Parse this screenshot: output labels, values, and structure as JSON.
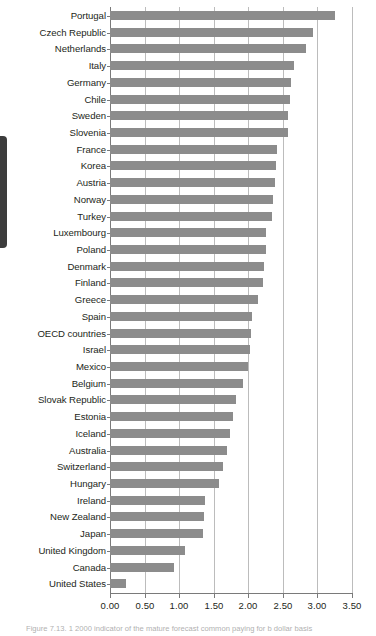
{
  "figure": {
    "caption": "Figure 7.13. 1 2000 indicator of the mature forecast common paying for   b   dollar basis"
  },
  "chart_data": {
    "type": "bar",
    "orientation": "horizontal",
    "title": "",
    "xlabel": "",
    "ylabel": "",
    "xlim": [
      0.0,
      3.5
    ],
    "xticks": [
      "0.00",
      "0.50",
      "1.00",
      "1.50",
      "2.00",
      "2.50",
      "3.00",
      "3.50"
    ],
    "xtick_values": [
      0.0,
      0.5,
      1.0,
      1.5,
      2.0,
      2.5,
      3.0,
      3.5
    ],
    "grid": true,
    "legend": false,
    "bar_color": "#8c8c8c",
    "categories": [
      "Portugal",
      "Czech Republic",
      "Netherlands",
      "Italy",
      "Germany",
      "Chile",
      "Sweden",
      "Slovenia",
      "France",
      "Korea",
      "Austria",
      "Norway",
      "Turkey",
      "Luxembourg",
      "Poland",
      "Denmark",
      "Finland",
      "Greece",
      "Spain",
      "OECD countries",
      "Israel",
      "Mexico",
      "Belgium",
      "Slovak Republic",
      "Estonia",
      "Iceland",
      "Australia",
      "Switzerland",
      "Hungary",
      "Ireland",
      "New Zealand",
      "Japan",
      "United Kingdom",
      "Canada",
      "United States"
    ],
    "values": [
      3.26,
      2.93,
      2.83,
      2.66,
      2.62,
      2.6,
      2.58,
      2.57,
      2.41,
      2.4,
      2.38,
      2.36,
      2.34,
      2.26,
      2.25,
      2.23,
      2.21,
      2.14,
      2.06,
      2.04,
      2.02,
      2.0,
      1.92,
      1.82,
      1.78,
      1.74,
      1.69,
      1.63,
      1.58,
      1.38,
      1.36,
      1.35,
      1.08,
      0.93,
      0.23
    ]
  }
}
